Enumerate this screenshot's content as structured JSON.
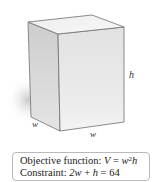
{
  "figure": {
    "labels": {
      "height": "h",
      "width_left": "w",
      "width_bottom": "w"
    },
    "colors": {
      "front_face": "#e6e6e6",
      "side_face": "#d2d2d2",
      "top_face": "#f2f2f2",
      "edge": "#6e6e6e",
      "shadow": "#cfcfcf"
    }
  },
  "info_box": {
    "objective_prefix": "Objective function: ",
    "objective_lhs": "V",
    "objective_eq": " = ",
    "objective_base": "w",
    "objective_exp": "2",
    "objective_tail": "h",
    "constraint_prefix": "Constraint: ",
    "constraint_expr_a": "2w",
    "constraint_op": " + ",
    "constraint_expr_b": "h",
    "constraint_rhs": " = 64"
  }
}
